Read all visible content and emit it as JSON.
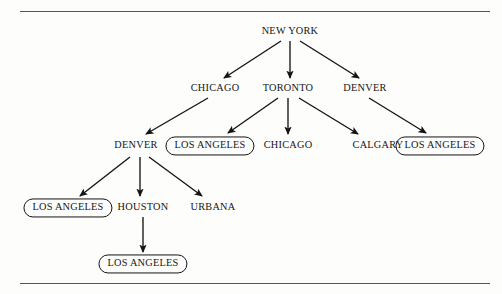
{
  "figure": {
    "type": "tree-diagram",
    "title": "",
    "background_color": "#fdfdfc",
    "ink_color": "#141414",
    "rule_color": "#565656"
  },
  "rules": [
    {
      "name": "top-rule",
      "x": 20,
      "y": 11,
      "width": 470
    },
    {
      "name": "bottom-rule",
      "x": 20,
      "y": 283,
      "width": 470
    }
  ],
  "chart_data": {
    "type": "tree",
    "levels": 5,
    "nodes": [
      {
        "id": "n0",
        "label": "NEW YORK",
        "x": 290,
        "y": 32,
        "level": 0,
        "boxed": false
      },
      {
        "id": "n1",
        "label": "CHICAGO",
        "x": 215,
        "y": 89,
        "level": 1,
        "boxed": false
      },
      {
        "id": "n2",
        "label": "TORONTO",
        "x": 288,
        "y": 89,
        "level": 1,
        "boxed": false
      },
      {
        "id": "n3",
        "label": "DENVER",
        "x": 365,
        "y": 89,
        "level": 1,
        "boxed": false
      },
      {
        "id": "n4",
        "label": "DENVER",
        "x": 136,
        "y": 146,
        "level": 2,
        "boxed": false
      },
      {
        "id": "n5",
        "label": "LOS ANGELES",
        "x": 210,
        "y": 146,
        "level": 2,
        "boxed": true
      },
      {
        "id": "n6",
        "label": "CHICAGO",
        "x": 288,
        "y": 146,
        "level": 2,
        "boxed": false
      },
      {
        "id": "n7",
        "label": "CALGARY",
        "x": 378,
        "y": 146,
        "level": 2,
        "boxed": false
      },
      {
        "id": "n8",
        "label": "LOS ANGELES",
        "x": 440,
        "y": 146,
        "level": 2,
        "boxed": true
      },
      {
        "id": "n9",
        "label": "LOS ANGELES",
        "x": 68,
        "y": 208,
        "level": 3,
        "boxed": true
      },
      {
        "id": "n10",
        "label": "HOUSTON",
        "x": 143,
        "y": 208,
        "level": 3,
        "boxed": false
      },
      {
        "id": "n11",
        "label": "URBANA",
        "x": 213,
        "y": 208,
        "level": 3,
        "boxed": false
      },
      {
        "id": "n12",
        "label": "LOS ANGELES",
        "x": 143,
        "y": 264,
        "level": 4,
        "boxed": true
      }
    ],
    "edges": [
      {
        "from": "n0",
        "to": "n1",
        "x1": 281,
        "y1": 41,
        "x2": 224,
        "y2": 78
      },
      {
        "from": "n0",
        "to": "n2",
        "x1": 290,
        "y1": 41,
        "x2": 290,
        "y2": 78
      },
      {
        "from": "n0",
        "to": "n3",
        "x1": 300,
        "y1": 41,
        "x2": 359,
        "y2": 78
      },
      {
        "from": "n1",
        "to": "n4",
        "x1": 208,
        "y1": 98,
        "x2": 146,
        "y2": 134
      },
      {
        "from": "n2",
        "to": "n5",
        "x1": 278,
        "y1": 98,
        "x2": 228,
        "y2": 133
      },
      {
        "from": "n2",
        "to": "n6",
        "x1": 288,
        "y1": 98,
        "x2": 288,
        "y2": 134
      },
      {
        "from": "n2",
        "to": "n7",
        "x1": 299,
        "y1": 98,
        "x2": 358,
        "y2": 134
      },
      {
        "from": "n3",
        "to": "n8",
        "x1": 369,
        "y1": 98,
        "x2": 426,
        "y2": 133
      },
      {
        "from": "n4",
        "to": "n9",
        "x1": 130,
        "y1": 157,
        "x2": 80,
        "y2": 196
      },
      {
        "from": "n4",
        "to": "n10",
        "x1": 140,
        "y1": 157,
        "x2": 140,
        "y2": 196
      },
      {
        "from": "n4",
        "to": "n11",
        "x1": 149,
        "y1": 157,
        "x2": 202,
        "y2": 196
      },
      {
        "from": "n10",
        "to": "n12",
        "x1": 143,
        "y1": 217,
        "x2": 143,
        "y2": 252
      }
    ]
  },
  "labels": {
    "n0": "NEW YORK",
    "n1": "CHICAGO",
    "n2": "TORONTO",
    "n3": "DENVER",
    "n4": "DENVER",
    "n5": "LOS ANGELES",
    "n6": "CHICAGO",
    "n7": "CALGARY",
    "n8": "LOS ANGELES",
    "n9": "LOS ANGELES",
    "n10": "HOUSTON",
    "n11": "URBANA",
    "n12": "LOS ANGELES"
  }
}
